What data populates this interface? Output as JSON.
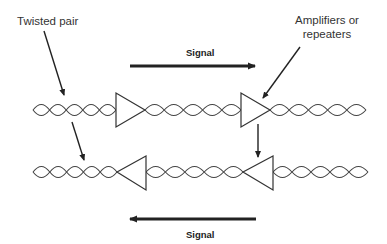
{
  "labels": {
    "twisted_pair": "Twisted pair",
    "amplifiers_line1": "Amplifiers or",
    "amplifiers_line2": "repeaters",
    "signal_top": "Signal",
    "signal_bottom": "Signal"
  },
  "colors": {
    "stroke": "#333333",
    "background": "#ffffff"
  }
}
